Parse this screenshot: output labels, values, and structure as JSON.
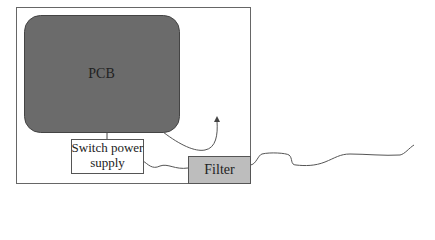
{
  "diagram": {
    "pcb": {
      "label": "PCB",
      "fill": "#6b6b6b"
    },
    "switch_power_supply": {
      "line1": "Switch power",
      "line2": "supply"
    },
    "filter": {
      "label": "Filter",
      "fill": "#bdbdbd"
    },
    "enclosure": {
      "stroke": "#555555"
    }
  }
}
